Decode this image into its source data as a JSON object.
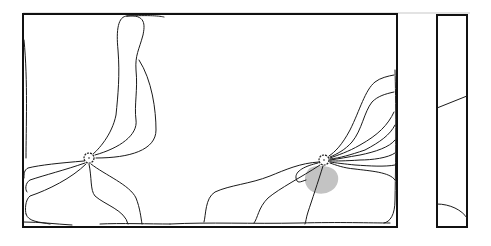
{
  "figure": {
    "width": 491,
    "height": 246,
    "colors": {
      "stroke": "#1a1a1a",
      "frame": "#111111",
      "top_rule": "#c8c8c8",
      "shade": "#bdbdbd",
      "background": "#ffffff"
    },
    "top_rule": {
      "x1": 23,
      "y1": 13,
      "x2": 470,
      "y2": 13
    },
    "main_panel": {
      "x": 23,
      "y": 14,
      "width": 374,
      "height": 213
    },
    "side_panel": {
      "x": 437,
      "y": 15,
      "width": 30,
      "height": 212
    },
    "nodes": [
      {
        "name": "left-node",
        "cx": 89,
        "cy": 158,
        "r": 5
      },
      {
        "name": "right-node",
        "cx": 324,
        "cy": 160,
        "r": 5
      }
    ],
    "shade_region": {
      "d": "M308,170 C302,178 305,190 316,193 C328,196 340,188 338,176 C336,168 328,166 320,166 C314,166 310,167 308,170 Z"
    },
    "lines_left": [
      "M127,16 C118,16 116,30 118,50 C120,75 118,95 116,115 C112,135 98,150 93,154",
      "M127,16 C146,14 145,25 143,35 C139,50 135,55 136,70 C138,90 134,105 136,120 C138,135 120,148 95,155",
      "M139,60 C152,80 156,110 156,130 C156,150 130,158 96,158",
      "M127,16 C150,15 160,16 164,17",
      "M84,161 C60,163 40,165 28,168 C24,170 24,174 24,178",
      "M85,163 C65,170 45,175 30,180 C25,183 25,190 27,192",
      "M86,164 C72,178 48,190 30,196 C25,200 25,210 26,214",
      "M89,164 C92,178 90,190 95,196 C105,205 125,210 128,224",
      "M91,164 C105,175 130,185 136,198 C140,208 141,218 142,224",
      "M24,40 C28,80 26,130 26,158",
      "M26,214 C28,222 40,222 50,224"
    ],
    "lines_right": [
      "M394,75 C388,76 380,78 375,82 C365,90 360,110 350,130 C342,145 335,152 329,156",
      "M394,92 C385,94 378,96 372,102 C364,112 362,130 352,142 C345,150 337,154 330,157",
      "M394,112 C388,125 378,135 360,145 C348,152 338,155 330,158",
      "M395,125 C390,135 380,142 365,150 C350,155 340,158 330,159",
      "M395,140 C390,147 375,152 360,155 C348,157 338,159 330,160",
      "M395,153 C388,158 372,160 360,160 C345,161 337,161 330,161",
      "M395,165 C385,167 370,166 355,165 C345,164 336,163 330,162",
      "M395,180 C390,172 370,171 355,169 C343,168 336,165 330,163",
      "M319,162 C300,163 285,170 270,176 C250,184 230,185 215,192 C205,198 206,215 204,222",
      "M318,163 C305,166 295,171 296,178 C297,184 300,182 306,180",
      "M320,165 C300,178 280,188 268,198 C258,208 258,218 254,223",
      "M323,166 C318,182 312,200 308,212 C306,218 306,222 305,224",
      "M395,70 C396,100 396,150 395,200 C395,215 390,222 384,223",
      "M170,224 C210,222 250,224 300,223 C340,222 370,223 390,223"
    ],
    "bottom_edge_lines": [
      "M24,222 C40,222 55,224 72,225",
      "M100,224 C120,223 150,224 170,224"
    ],
    "side_panel_lines": [
      "M437,108 C447,104 457,100 467,96",
      "M437,204 C450,204 462,210 467,218"
    ]
  }
}
